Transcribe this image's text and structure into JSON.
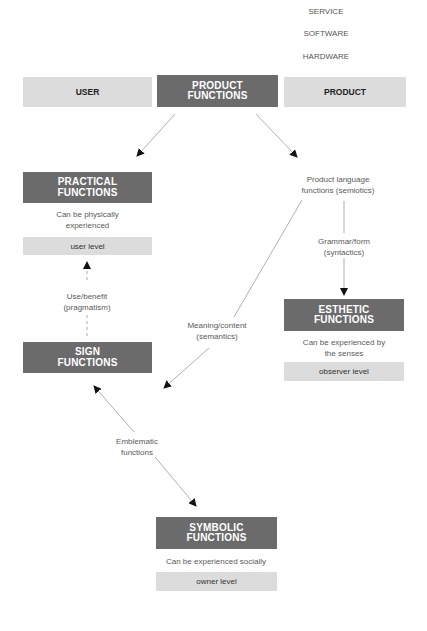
{
  "layers": [
    "SERVICE",
    "SOFTWARE",
    "HARDWARE"
  ],
  "header": {
    "user": "USER",
    "product_functions": [
      "PRODUCT",
      "FUNCTIONS"
    ],
    "product": "PRODUCT"
  },
  "practical": {
    "title": [
      "PRACTICAL",
      "FUNCTIONS"
    ],
    "desc": [
      "Can be physically",
      "experienced"
    ],
    "level": "user level"
  },
  "pragmatism": [
    "Use/benefit",
    "(pragmatism)"
  ],
  "sign": {
    "title": [
      "SIGN",
      "FUNCTIONS"
    ]
  },
  "product_language": [
    "Product language",
    "functions (semiotics)"
  ],
  "syntactics": [
    "Grammar/form",
    "(syntactics)"
  ],
  "semantics": [
    "Meaning/content",
    "(semantics)"
  ],
  "esthetic": {
    "title": [
      "ESTHETIC",
      "FUNCTIONS"
    ],
    "desc": [
      "Can be experienced by",
      "the senses"
    ],
    "level": "observer level"
  },
  "emblematic": [
    "Emblematic",
    "functions"
  ],
  "symbolic": {
    "title": [
      "SYMBOLIC",
      "FUNCTIONS"
    ],
    "desc": "Can be experienced socially",
    "level": "owner level"
  },
  "colors": {
    "dark_box": "#6b6b6b",
    "light_box": "#dcdcdc",
    "line": "#9a9a9a",
    "arrowhead": "#111111"
  }
}
